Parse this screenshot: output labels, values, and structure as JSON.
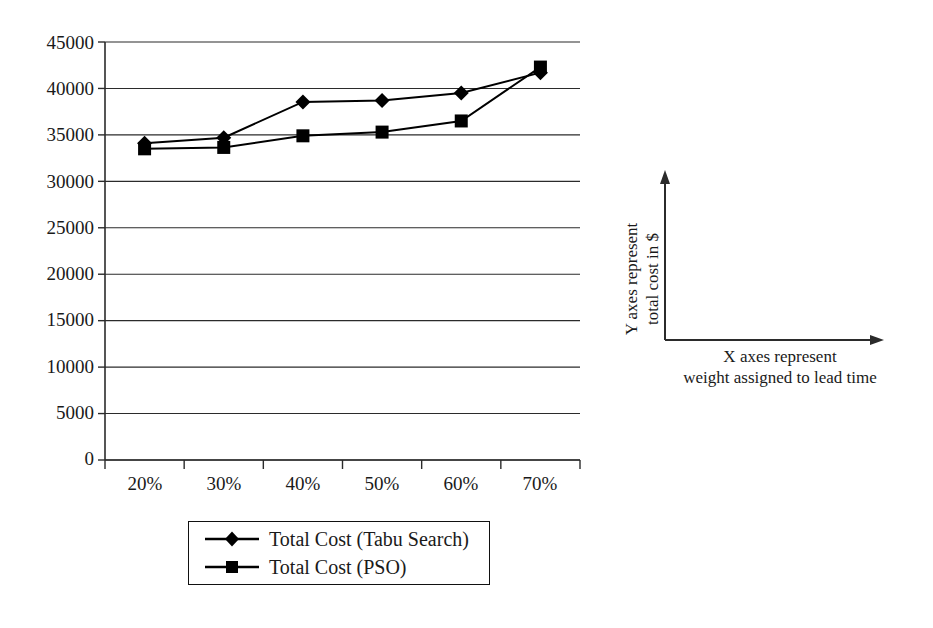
{
  "chart_data": {
    "type": "line",
    "title": "",
    "subtitle": "",
    "xlabel": "",
    "ylabel": "",
    "categories": [
      "20%",
      "30%",
      "40%",
      "50%",
      "60%",
      "70%"
    ],
    "series": [
      {
        "name": "Total Cost (Tabu Search)",
        "marker": "diamond",
        "color": "#000000",
        "values": [
          34100,
          34700,
          38550,
          38700,
          39500,
          41700
        ]
      },
      {
        "name": "Total Cost (PSO)",
        "marker": "square",
        "color": "#000000",
        "values": [
          33500,
          33650,
          34900,
          35300,
          36500,
          42300
        ]
      }
    ],
    "ylim": [
      0,
      45000
    ],
    "ytick_values": [
      0,
      5000,
      10000,
      15000,
      20000,
      25000,
      30000,
      35000,
      40000,
      45000
    ],
    "ytick_labels": [
      "0",
      "5000",
      "10000",
      "15000",
      "20000",
      "25000",
      "30000",
      "35000",
      "40000",
      "45000"
    ],
    "grid": "horizontal",
    "legend_position": "bottom"
  },
  "legend": {
    "entries": [
      {
        "label": "Total Cost (Tabu Search)",
        "marker": "diamond-marker"
      },
      {
        "label": "Total Cost (PSO)",
        "marker": "square-marker"
      }
    ]
  },
  "axis_note": {
    "y_text_line1": "Y axes represent",
    "y_text_line2": "total cost in $",
    "y_text": "Y axes represent total cost in $",
    "x_text_line1": "X axes represent",
    "x_text_line2": "weight assigned to lead time"
  },
  "colors": {
    "line": "#000000",
    "grid": "#2b2b2b",
    "axis": "#2b2b2b",
    "text": "#1a1a1a",
    "background": "#ffffff"
  }
}
